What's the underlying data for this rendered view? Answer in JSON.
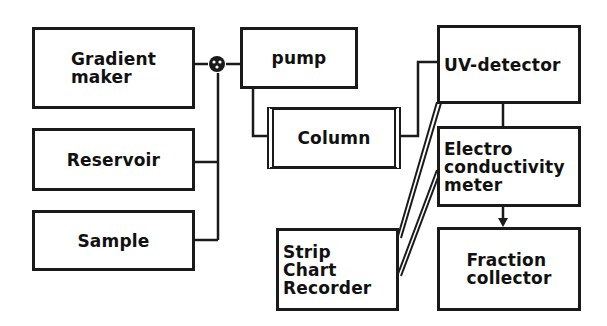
{
  "diagram": {
    "type": "flow-schematic",
    "nodes": [
      {
        "id": "gradient_maker",
        "label": "Gradient\nmaker"
      },
      {
        "id": "reservoir",
        "label": "Reservoir"
      },
      {
        "id": "sample",
        "label": "Sample"
      },
      {
        "id": "mixer",
        "label": "",
        "shape": "circle-valve"
      },
      {
        "id": "pump",
        "label": "pump"
      },
      {
        "id": "column",
        "label": "Column"
      },
      {
        "id": "uv_detector",
        "label": "UV-detector"
      },
      {
        "id": "conductivity_meter",
        "label": "Electro\nconductivity\nmeter"
      },
      {
        "id": "strip_chart_recorder",
        "label": "Strip\nChart\nRecorder"
      },
      {
        "id": "fraction_collector",
        "label": "Fraction\ncollector"
      }
    ],
    "edges": [
      {
        "from": "gradient_maker",
        "to": "mixer"
      },
      {
        "from": "reservoir",
        "to": "mixer"
      },
      {
        "from": "sample",
        "to": "mixer"
      },
      {
        "from": "mixer",
        "to": "pump"
      },
      {
        "from": "pump",
        "to": "column"
      },
      {
        "from": "column",
        "to": "uv_detector"
      },
      {
        "from": "uv_detector",
        "to": "conductivity_meter"
      },
      {
        "from": "conductivity_meter",
        "to": "fraction_collector",
        "arrow": true
      },
      {
        "from": "uv_detector",
        "to": "strip_chart_recorder",
        "style": "double"
      },
      {
        "from": "conductivity_meter",
        "to": "strip_chart_recorder",
        "style": "double"
      }
    ]
  },
  "labels": {
    "gradient_maker": "Gradient\nmaker",
    "reservoir": "Reservoir",
    "sample": "Sample",
    "pump": "pump",
    "column": "Column",
    "uv_detector": "UV-detector",
    "conductivity_meter": "Electro\nconductivity\nmeter",
    "strip_chart_recorder": "Strip\nChart\nRecorder",
    "fraction_collector": "Fraction\ncollector"
  }
}
